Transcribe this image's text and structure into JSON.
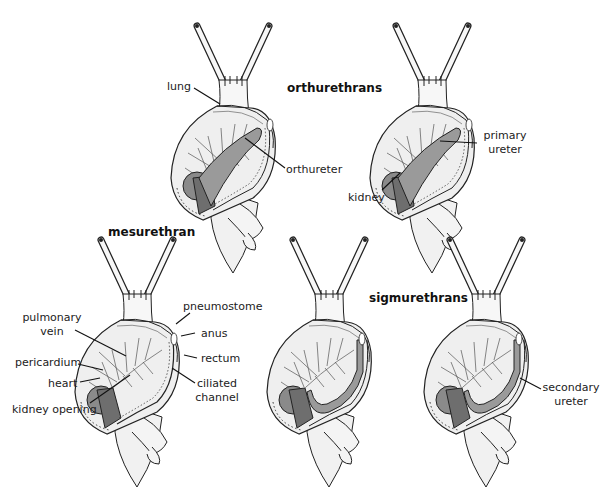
{
  "figure": {
    "groups": {
      "orthurethrans": "orthurethrans",
      "mesurethran": "mesurethran",
      "sigmurethrans": "sigmurethrans"
    },
    "labels": {
      "lung": "lung",
      "orthureter": "orthureter",
      "primary_ureter_1": "primary",
      "primary_ureter_2": "ureter",
      "kidney": "kidney",
      "pulmonary_vein_1": "pulmonary",
      "pulmonary_vein_2": "vein",
      "pericardium": "pericardium",
      "heart": "heart",
      "kidney_opening": "kidney opening",
      "pneumostome": "pneumostome",
      "anus": "anus",
      "rectum": "rectum",
      "ciliated_channel_1": "ciliated",
      "ciliated_channel_2": "channel",
      "secondary_ureter_1": "secondary",
      "secondary_ureter_2": "ureter"
    },
    "colors": {
      "outline": "#222222",
      "body_fill": "#f4f4f4",
      "mantle_fill": "#ececec",
      "kidney_fill": "#6e6e6e",
      "pericardium_fill": "#8a8a8a",
      "ureter_fill": "#9a9a9a"
    }
  }
}
